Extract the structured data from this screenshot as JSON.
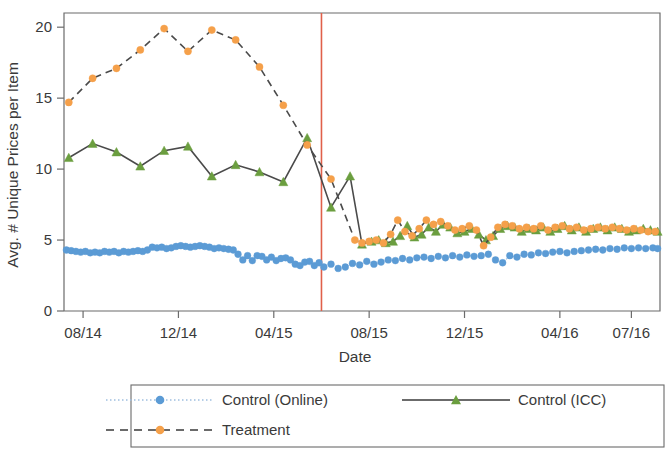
{
  "chart_data": {
    "type": "line",
    "title": "",
    "xlabel": "Date",
    "ylabel": "Avg. # Unique Prices per Item",
    "ylim": [
      0,
      21
    ],
    "yticks": [
      0,
      5,
      10,
      15,
      20
    ],
    "ytick_labels": [
      "0",
      "5",
      "10",
      "15",
      "20"
    ],
    "xtick_labels": [
      "08/14",
      "12/14",
      "04/15",
      "08/15",
      "12/15",
      "04/16",
      "07/16"
    ],
    "xtick_months": [
      7,
      11,
      15,
      19,
      23,
      27,
      30
    ],
    "x_range_months": [
      6.2,
      31.2
    ],
    "grid": false,
    "legend_position": "below-center",
    "annotations": [
      {
        "type": "vline",
        "label": "treatment start",
        "x_month": 17.0,
        "color": "#e0604a"
      }
    ],
    "series": [
      {
        "name": "Control (Online)",
        "color": "#5B9BD5",
        "marker": "circle",
        "linestyle": "dotted",
        "x": [
          6.3,
          6.5,
          6.7,
          6.9,
          7.1,
          7.3,
          7.5,
          7.7,
          7.9,
          8.1,
          8.3,
          8.5,
          8.7,
          8.9,
          9.1,
          9.3,
          9.5,
          9.7,
          9.9,
          10.1,
          10.3,
          10.5,
          10.7,
          10.9,
          11.1,
          11.3,
          11.5,
          11.7,
          11.9,
          12.1,
          12.3,
          12.5,
          12.7,
          12.9,
          13.1,
          13.3,
          13.5,
          13.7,
          13.9,
          14.1,
          14.3,
          14.5,
          14.7,
          14.9,
          15.1,
          15.3,
          15.5,
          15.7,
          15.9,
          16.1,
          16.3,
          16.5,
          16.7,
          16.9,
          17.1,
          17.4,
          17.7,
          18.0,
          18.3,
          18.6,
          18.9,
          19.2,
          19.5,
          19.8,
          20.1,
          20.4,
          20.7,
          21.0,
          21.3,
          21.6,
          21.9,
          22.2,
          22.5,
          22.8,
          23.1,
          23.4,
          23.7,
          24.0,
          24.3,
          24.6,
          24.9,
          25.2,
          25.5,
          25.8,
          26.1,
          26.4,
          26.7,
          27.0,
          27.3,
          27.6,
          27.9,
          28.2,
          28.5,
          28.8,
          29.1,
          29.4,
          29.7,
          30.0,
          30.3,
          30.6,
          30.9,
          31.1
        ],
        "y": [
          4.3,
          4.25,
          4.2,
          4.15,
          4.2,
          4.1,
          4.15,
          4.1,
          4.2,
          4.15,
          4.2,
          4.1,
          4.2,
          4.15,
          4.2,
          4.25,
          4.2,
          4.3,
          4.5,
          4.45,
          4.5,
          4.4,
          4.45,
          4.55,
          4.6,
          4.55,
          4.5,
          4.55,
          4.6,
          4.55,
          4.5,
          4.4,
          4.45,
          4.4,
          4.35,
          4.3,
          4.0,
          3.6,
          3.9,
          3.55,
          3.9,
          3.85,
          3.6,
          3.8,
          3.55,
          3.7,
          3.75,
          3.6,
          3.3,
          3.2,
          3.45,
          3.5,
          3.2,
          3.4,
          3.1,
          3.3,
          3.0,
          3.1,
          3.35,
          3.25,
          3.5,
          3.3,
          3.45,
          3.6,
          3.55,
          3.7,
          3.6,
          3.75,
          3.8,
          3.7,
          3.85,
          3.75,
          3.9,
          3.8,
          3.95,
          3.85,
          3.9,
          4.0,
          3.6,
          3.4,
          3.9,
          3.8,
          4.0,
          3.95,
          4.1,
          4.05,
          4.15,
          4.2,
          4.1,
          4.2,
          4.25,
          4.3,
          4.35,
          4.3,
          4.4,
          4.35,
          4.45,
          4.4,
          4.45,
          4.4,
          4.45,
          4.4
        ]
      },
      {
        "name": "Control (ICC)",
        "color": "#6B9E3F",
        "marker": "triangle",
        "linestyle": "solid",
        "x": [
          6.4,
          7.4,
          8.4,
          9.4,
          10.4,
          11.4,
          12.4,
          13.4,
          14.4,
          15.4,
          16.4,
          17.4,
          18.2,
          18.7,
          19.1,
          19.4,
          19.7,
          20.0,
          20.3,
          20.6,
          20.9,
          21.2,
          21.5,
          21.8,
          22.1,
          22.4,
          22.7,
          23.0,
          23.3,
          23.6,
          23.9,
          24.2,
          24.5,
          24.8,
          25.1,
          25.4,
          25.7,
          26.0,
          26.3,
          26.6,
          26.9,
          27.2,
          27.5,
          27.8,
          28.1,
          28.4,
          28.7,
          29.0,
          29.3,
          29.6,
          29.9,
          30.2,
          30.5,
          30.8,
          31.1
        ],
        "y": [
          10.8,
          11.8,
          11.2,
          10.2,
          11.3,
          11.6,
          9.5,
          10.3,
          9.8,
          9.1,
          12.2,
          7.3,
          9.5,
          4.7,
          4.9,
          5.0,
          4.8,
          4.9,
          5.3,
          6.0,
          5.2,
          5.4,
          5.9,
          5.6,
          6.1,
          5.9,
          5.5,
          5.6,
          5.8,
          5.4,
          5.0,
          5.3,
          5.8,
          6.0,
          5.9,
          5.6,
          5.8,
          5.7,
          5.9,
          5.6,
          5.8,
          6.0,
          5.7,
          5.9,
          5.6,
          5.8,
          5.9,
          5.7,
          5.9,
          5.8,
          5.6,
          5.7,
          5.8,
          5.7,
          5.6
        ]
      },
      {
        "name": "Treatment",
        "color": "#F5A04A",
        "marker": "circle",
        "linestyle": "dashed",
        "x": [
          6.4,
          7.4,
          8.4,
          9.4,
          10.4,
          11.4,
          12.4,
          13.4,
          14.4,
          15.4,
          16.4,
          17.4,
          18.4,
          18.7,
          19.0,
          19.3,
          19.6,
          19.9,
          20.2,
          20.5,
          20.8,
          21.1,
          21.4,
          21.7,
          22.0,
          22.3,
          22.6,
          22.9,
          23.2,
          23.5,
          23.8,
          24.1,
          24.4,
          24.7,
          25.0,
          25.3,
          25.6,
          25.9,
          26.2,
          26.5,
          26.8,
          27.1,
          27.4,
          27.7,
          28.0,
          28.3,
          28.6,
          28.9,
          29.2,
          29.5,
          29.8,
          30.1,
          30.4,
          30.7,
          31.0
        ],
        "y": [
          14.7,
          16.4,
          17.1,
          18.4,
          19.9,
          18.3,
          19.8,
          19.1,
          17.2,
          14.5,
          11.7,
          9.3,
          5.0,
          4.8,
          4.9,
          5.0,
          4.8,
          5.4,
          6.4,
          5.6,
          5.3,
          5.8,
          6.4,
          6.1,
          6.3,
          6.0,
          5.7,
          5.8,
          6.0,
          5.7,
          4.6,
          5.2,
          5.9,
          6.1,
          6.0,
          5.8,
          5.9,
          5.8,
          6.0,
          5.7,
          5.9,
          6.0,
          5.8,
          5.9,
          5.7,
          5.8,
          5.9,
          5.8,
          5.9,
          5.8,
          5.7,
          5.8,
          5.7,
          5.6,
          5.6
        ]
      }
    ]
  },
  "legend": {
    "items": [
      {
        "label": "Control (Online)",
        "style": "dotted-circle",
        "color": "#5B9BD5"
      },
      {
        "label": "Control (ICC)",
        "style": "solid-triangle",
        "color": "#6B9E3F"
      },
      {
        "label": "Treatment",
        "style": "dashed-circle",
        "color": "#F5A04A"
      }
    ]
  },
  "colors": {
    "online": "#5B9BD5",
    "icc": "#6B9E3F",
    "treatment": "#F5A04A",
    "vline": "#e0604a",
    "axis": "#6b6b6b",
    "text": "#3a3a3a"
  }
}
